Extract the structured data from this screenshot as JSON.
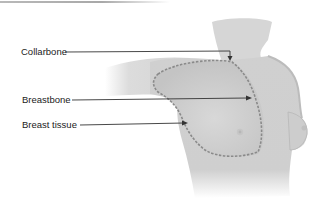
{
  "figure": {
    "type": "anatomical illustration",
    "colors": {
      "skin": "#d4d4d4",
      "skin_shadow": "#b5b5b5",
      "outline_dashed": "#8a8a8a",
      "leader_line": "#333333",
      "label_text": "#222222"
    }
  },
  "labels": [
    {
      "text": "Collarbone",
      "target": "collarbone"
    },
    {
      "text": "Breastbone",
      "target": "breastbone"
    },
    {
      "text": "Breast tissue",
      "target": "breast-tissue-boundary"
    }
  ]
}
